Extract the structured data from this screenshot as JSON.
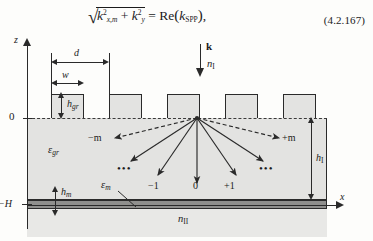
{
  "equation": {
    "number": "(4.2.167)",
    "lhs_radicand_term1_base": "k",
    "lhs_radicand_term1_sub": "x,m",
    "lhs_radicand_term1_sup": "2",
    "lhs_plus": "+",
    "lhs_radicand_term2_base": "k",
    "lhs_radicand_term2_sub": "y",
    "lhs_radicand_term2_sup": "2",
    "equals": "=",
    "rhs_function": "Re",
    "rhs_arg_base": "k",
    "rhs_arg_sub": "SPP",
    "trailing_comma": ","
  },
  "figure": {
    "axes": {
      "z_label": "z",
      "x_label": "x",
      "origin_label": "0",
      "bottom_label": "−H"
    },
    "dimensions": {
      "period_label": "d",
      "tooth_width_label": "w",
      "grating_height_base": "h",
      "grating_height_sub": "gr",
      "layer_height_base": "h",
      "layer_height_sub": "I",
      "metal_height_base": "h",
      "metal_height_sub": "m"
    },
    "media": {
      "superstrate_base": "n",
      "superstrate_sub": "I",
      "grating_eps_base": "ε",
      "grating_eps_sub": "gr",
      "metal_eps_base": "ε",
      "metal_eps_sub": "m",
      "substrate_base": "n",
      "substrate_sub": "II"
    },
    "incident_wave": {
      "k_label": "k"
    },
    "diffraction_orders": {
      "minus_m": "−m",
      "plus_m": "+m",
      "minus_one": "−1",
      "zero": "0",
      "plus_one": "+1",
      "left_ellipsis": "•••",
      "right_ellipsis": "•••"
    },
    "colors": {
      "ink": "#2a2a2a",
      "dielectric_fill": "#e3e3e1",
      "metal_fill": "#8f8f8d",
      "substrate_fill": "#e8e8e6",
      "page": "#fdfdfb"
    }
  }
}
